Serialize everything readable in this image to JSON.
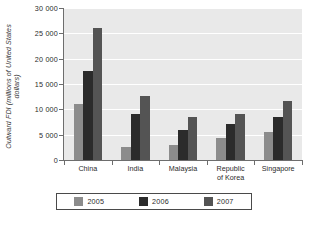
{
  "chart_data": {
    "type": "bar",
    "title": "",
    "xlabel": "",
    "ylabel": "Outward FDI (millions of United States dollars)",
    "ylabel_line1": "Outward FDI (millions of United States",
    "ylabel_line2": "dollars)",
    "categories": [
      "China",
      "India",
      "Malaysia",
      "Republic of Korea",
      "Singapore"
    ],
    "category_lines": [
      [
        "China",
        ""
      ],
      [
        "India",
        ""
      ],
      [
        "Malaysia",
        ""
      ],
      [
        "Republic",
        "of Korea"
      ],
      [
        "Singapore",
        ""
      ]
    ],
    "series": [
      {
        "name": "2005",
        "color": "#8c8c8c",
        "values": [
          11000,
          2500,
          3000,
          4300,
          5500
        ]
      },
      {
        "name": "2006",
        "color": "#2b2b2b",
        "values": [
          17600,
          9000,
          6000,
          7100,
          8500
        ]
      },
      {
        "name": "2007",
        "color": "#545454",
        "values": [
          26000,
          12700,
          8500,
          9000,
          11700
        ]
      }
    ],
    "ylim": [
      0,
      30000
    ],
    "yticks": [
      0,
      5000,
      10000,
      15000,
      20000,
      25000,
      30000
    ],
    "ytick_labels": [
      "0",
      "5 000",
      "10 000",
      "15 000",
      "20 000",
      "25 000",
      "30 000"
    ],
    "grid": true,
    "grid_color": "#ffffff",
    "plot_background": "#e9e9e9",
    "legend_position": "bottom",
    "legend_entries": [
      "2005",
      "2006",
      "2007"
    ]
  }
}
